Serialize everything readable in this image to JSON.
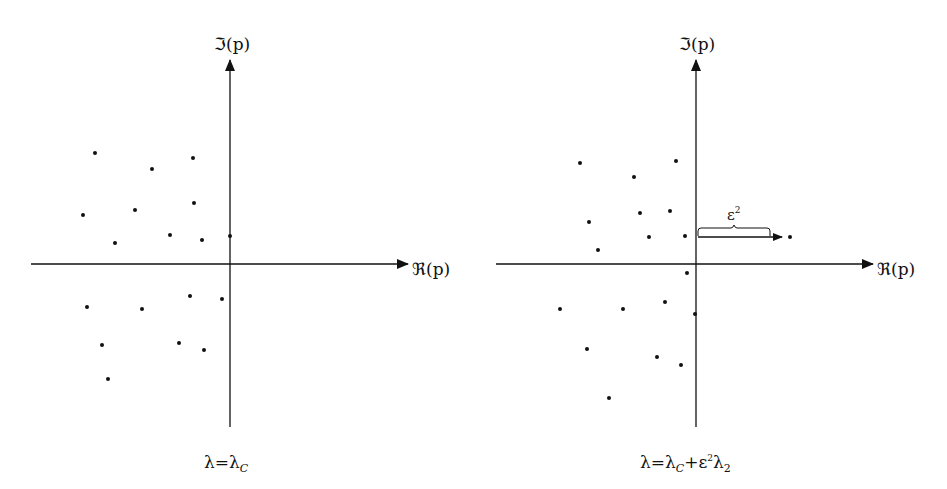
{
  "panels": [
    {
      "id": "left",
      "y_axis_label": "ℑ(p)",
      "x_axis_label": "ℜ(p)",
      "caption": {
        "main": "λ=λ",
        "sub": "C"
      },
      "origin": [
        230,
        264
      ],
      "poles": [
        [
          95,
          153
        ],
        [
          193,
          158
        ],
        [
          152,
          169
        ],
        [
          194,
          203
        ],
        [
          135,
          210
        ],
        [
          83,
          215
        ],
        [
          170,
          235
        ],
        [
          202,
          240
        ],
        [
          230,
          236
        ],
        [
          115,
          243
        ],
        [
          190,
          296
        ],
        [
          222,
          299
        ],
        [
          87,
          307
        ],
        [
          142,
          309
        ],
        [
          102,
          345
        ],
        [
          179,
          343
        ],
        [
          204,
          350
        ],
        [
          108,
          379
        ]
      ]
    },
    {
      "id": "right",
      "y_axis_label": "ℑ(p)",
      "x_axis_label": "ℜ(p)",
      "caption": {
        "main": "λ=λ",
        "sub": "C",
        "rest": "+ε",
        "sup": "2",
        "tail": "λ",
        "sub2": "2"
      },
      "annotation": {
        "label": "ε",
        "sup": "2"
      },
      "origin": [
        696,
        264
      ],
      "poles": [
        [
          580,
          163
        ],
        [
          676,
          161
        ],
        [
          634,
          177
        ],
        [
          640,
          213
        ],
        [
          670,
          211
        ],
        [
          589,
          222
        ],
        [
          649,
          237
        ],
        [
          685,
          236
        ],
        [
          598,
          250
        ],
        [
          790,
          237
        ],
        [
          687,
          273
        ],
        [
          665,
          302
        ],
        [
          560,
          309
        ],
        [
          623,
          309
        ],
        [
          695,
          314
        ],
        [
          587,
          349
        ],
        [
          657,
          357
        ],
        [
          681,
          365
        ],
        [
          609,
          398
        ]
      ]
    }
  ]
}
